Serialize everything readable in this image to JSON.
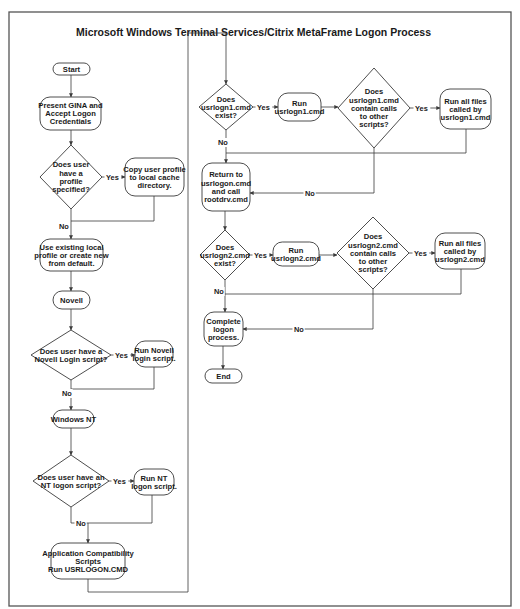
{
  "diagram": {
    "title": "Microsoft Windows Terminal Services/Citrix MetaFrame Logon Process",
    "nodes": [
      {
        "id": "start",
        "type": "terminal",
        "x": 53,
        "y": 63,
        "w": 37,
        "h": 12,
        "lines": [
          "Start"
        ]
      },
      {
        "id": "present-gina",
        "type": "process",
        "x": 40,
        "y": 97,
        "w": 61,
        "h": 33,
        "lines": [
          "Present GINA and",
          "Accept Logon",
          "Credentials"
        ]
      },
      {
        "id": "profile-specified",
        "type": "decision",
        "cx": 71,
        "cy": 177,
        "w": 62,
        "h": 64,
        "lines": [
          "Does user",
          "have a",
          "profile",
          "specified?"
        ]
      },
      {
        "id": "copy-profile",
        "type": "process",
        "x": 125,
        "y": 158,
        "w": 59,
        "h": 38,
        "lines": [
          "Copy user profile",
          "to local cache",
          "directory."
        ]
      },
      {
        "id": "use-existing",
        "type": "process",
        "x": 40,
        "y": 239,
        "w": 63,
        "h": 32,
        "lines": [
          "Use existing local",
          "profile or create new",
          "from default."
        ]
      },
      {
        "id": "novell",
        "type": "terminal",
        "x": 53,
        "y": 291,
        "w": 37,
        "h": 18,
        "lines": [
          "Novell"
        ]
      },
      {
        "id": "novell-script-q",
        "type": "decision",
        "cx": 71,
        "cy": 355,
        "w": 80,
        "h": 50,
        "lines": [
          "Does user have a",
          "Novell Login script?"
        ]
      },
      {
        "id": "run-novell",
        "type": "process",
        "x": 135,
        "y": 341,
        "w": 38,
        "h": 26,
        "lines": [
          "Run Novell",
          "login script."
        ]
      },
      {
        "id": "windows-nt",
        "type": "terminal",
        "x": 53,
        "y": 410,
        "w": 41,
        "h": 18,
        "lines": [
          "Windows NT"
        ]
      },
      {
        "id": "nt-script-q",
        "type": "decision",
        "cx": 71,
        "cy": 481,
        "w": 76,
        "h": 52,
        "lines": [
          "Does user have an",
          "NT logon script?"
        ]
      },
      {
        "id": "run-nt",
        "type": "process",
        "x": 134,
        "y": 469,
        "w": 40,
        "h": 26,
        "lines": [
          "Run NT",
          "logon script."
        ]
      },
      {
        "id": "app-compat",
        "type": "process",
        "x": 51,
        "y": 543,
        "w": 74,
        "h": 36,
        "lines": [
          "Application Compatibility",
          "Scripts",
          "Run USRLOGON.CMD"
        ]
      },
      {
        "id": "usrlogn1-exist",
        "type": "decision",
        "cx": 226,
        "cy": 107,
        "w": 54,
        "h": 46,
        "lines": [
          "Does",
          "usrlogn1.cmd",
          "exist?"
        ]
      },
      {
        "id": "run-usrlogn1",
        "type": "process",
        "x": 278,
        "y": 93,
        "w": 43,
        "h": 28,
        "lines": [
          "Run",
          "usrlogn1.cmd"
        ]
      },
      {
        "id": "usrlogn1-calls",
        "type": "decision",
        "cx": 374,
        "cy": 108,
        "w": 72,
        "h": 80,
        "lines": [
          "Does",
          "usrlogn1.cmd",
          "contain calls",
          "to other",
          "scripts?"
        ]
      },
      {
        "id": "run-all-1",
        "type": "process",
        "x": 440,
        "y": 89,
        "w": 51,
        "h": 40,
        "lines": [
          "Run all files",
          "called by",
          "usrlogn1.cmd"
        ]
      },
      {
        "id": "return-usrlogon",
        "type": "process",
        "x": 202,
        "y": 163,
        "w": 48,
        "h": 48,
        "lines": [
          "Return to",
          "usrlogon.cmd",
          "and call",
          "rootdrv.cmd"
        ]
      },
      {
        "id": "usrlogn2-exist",
        "type": "decision",
        "cx": 225,
        "cy": 255,
        "w": 50,
        "h": 50,
        "lines": [
          "Does",
          "usrlogn2.cmd",
          "exist?"
        ]
      },
      {
        "id": "run-usrlogn2",
        "type": "process",
        "x": 273,
        "y": 242,
        "w": 46,
        "h": 24,
        "lines": [
          "Run",
          "usrlogn2.cmd"
        ]
      },
      {
        "id": "usrlogn2-calls",
        "type": "decision",
        "cx": 373,
        "cy": 253,
        "w": 72,
        "h": 72,
        "lines": [
          "Does",
          "usrlogn2.cmd",
          "contain calls",
          "to other",
          "scripts?"
        ]
      },
      {
        "id": "run-all-2",
        "type": "process",
        "x": 435,
        "y": 233,
        "w": 50,
        "h": 36,
        "lines": [
          "Run all files",
          "called by",
          "usrlogn2.cmd"
        ]
      },
      {
        "id": "complete-logon",
        "type": "process",
        "x": 204,
        "y": 312,
        "w": 39,
        "h": 34,
        "lines": [
          "Complete",
          "logon",
          "process."
        ]
      },
      {
        "id": "end",
        "type": "terminal",
        "x": 205,
        "y": 369,
        "w": 37,
        "h": 14,
        "lines": [
          "End"
        ]
      }
    ],
    "edges": [
      {
        "points": [
          [
            71,
            75
          ],
          [
            71,
            97
          ]
        ],
        "arrow": true
      },
      {
        "points": [
          [
            71,
            130
          ],
          [
            71,
            145
          ]
        ],
        "arrow": true
      },
      {
        "points": [
          [
            102,
            177
          ],
          [
            125,
            177
          ]
        ],
        "arrow": true,
        "label": "Yes",
        "lx": 106,
        "ly": 180
      },
      {
        "points": [
          [
            154,
            196
          ],
          [
            154,
            221
          ],
          [
            71,
            221
          ]
        ],
        "arrow": false
      },
      {
        "points": [
          [
            71,
            209
          ],
          [
            71,
            239
          ]
        ],
        "arrow": true,
        "label": "No",
        "lx": 59,
        "ly": 229
      },
      {
        "points": [
          [
            71,
            271
          ],
          [
            71,
            291
          ]
        ],
        "arrow": true
      },
      {
        "points": [
          [
            71,
            309
          ],
          [
            71,
            330
          ]
        ],
        "arrow": true
      },
      {
        "points": [
          [
            111,
            355
          ],
          [
            135,
            355
          ]
        ],
        "arrow": true,
        "label": "Yes",
        "lx": 115,
        "ly": 358
      },
      {
        "points": [
          [
            154,
            367
          ],
          [
            154,
            389
          ],
          [
            71,
            389
          ]
        ],
        "arrow": false
      },
      {
        "points": [
          [
            71,
            380
          ],
          [
            71,
            410
          ]
        ],
        "arrow": true,
        "label": "No",
        "lx": 62,
        "ly": 396
      },
      {
        "points": [
          [
            71,
            428
          ],
          [
            71,
            455
          ]
        ],
        "arrow": true
      },
      {
        "points": [
          [
            109,
            481
          ],
          [
            134,
            481
          ]
        ],
        "arrow": true,
        "label": "Yes",
        "lx": 113,
        "ly": 484
      },
      {
        "points": [
          [
            152,
            495
          ],
          [
            152,
            523
          ],
          [
            88,
            523
          ]
        ],
        "arrow": false
      },
      {
        "points": [
          [
            71,
            507
          ],
          [
            71,
            523
          ],
          [
            88,
            523
          ],
          [
            88,
            543
          ]
        ],
        "arrow": true,
        "label": "No",
        "lx": 76,
        "ly": 526
      },
      {
        "points": [
          [
            88,
            579
          ],
          [
            88,
            592
          ],
          [
            188,
            592
          ],
          [
            188,
            33
          ],
          [
            226,
            33
          ],
          [
            226,
            84
          ]
        ],
        "arrow": true
      },
      {
        "points": [
          [
            253,
            107
          ],
          [
            278,
            107
          ]
        ],
        "arrow": true,
        "label": "Yes",
        "lx": 257,
        "ly": 110
      },
      {
        "points": [
          [
            321,
            107
          ],
          [
            338,
            107
          ]
        ],
        "arrow": true
      },
      {
        "points": [
          [
            410,
            108
          ],
          [
            440,
            108
          ]
        ],
        "arrow": true,
        "label": "Yes",
        "lx": 415,
        "ly": 111
      },
      {
        "points": [
          [
            466,
            129
          ],
          [
            466,
            153
          ],
          [
            226,
            153
          ]
        ],
        "arrow": false
      },
      {
        "points": [
          [
            226,
            130
          ],
          [
            226,
            163
          ]
        ],
        "arrow": true,
        "label": "No",
        "lx": 218,
        "ly": 145
      },
      {
        "points": [
          [
            374,
            148
          ],
          [
            374,
            193
          ],
          [
            250,
            193
          ]
        ],
        "arrow": true,
        "label": "No",
        "lx": 305,
        "ly": 196
      },
      {
        "points": [
          [
            225,
            211
          ],
          [
            225,
            230
          ]
        ],
        "arrow": true
      },
      {
        "points": [
          [
            250,
            255
          ],
          [
            273,
            255
          ]
        ],
        "arrow": true,
        "label": "Yes",
        "lx": 254,
        "ly": 258
      },
      {
        "points": [
          [
            319,
            255
          ],
          [
            337,
            255
          ]
        ],
        "arrow": true
      },
      {
        "points": [
          [
            409,
            253
          ],
          [
            435,
            253
          ]
        ],
        "arrow": true,
        "label": "Yes",
        "lx": 414,
        "ly": 256
      },
      {
        "points": [
          [
            461,
            269
          ],
          [
            461,
            294
          ],
          [
            225,
            294
          ]
        ],
        "arrow": false
      },
      {
        "points": [
          [
            225,
            280
          ],
          [
            225,
            312
          ]
        ],
        "arrow": true,
        "label": "No",
        "lx": 214,
        "ly": 294
      },
      {
        "points": [
          [
            373,
            289
          ],
          [
            373,
            329
          ],
          [
            243,
            329
          ]
        ],
        "arrow": true,
        "label": "No",
        "lx": 294,
        "ly": 332
      },
      {
        "points": [
          [
            223,
            346
          ],
          [
            223,
            369
          ]
        ],
        "arrow": true
      }
    ]
  }
}
